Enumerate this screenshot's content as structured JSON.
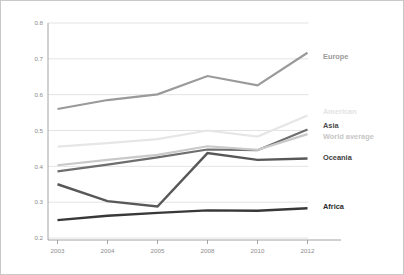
{
  "chart_data": {
    "type": "line",
    "title": "",
    "subtitle": "",
    "xlabel": "",
    "ylabel": "",
    "categories": [
      "2003",
      "2004",
      "2005",
      "2008",
      "2010",
      "2012"
    ],
    "x": [
      2003,
      2004,
      2005,
      2008,
      2010,
      2012
    ],
    "ylim": [
      0.2,
      0.8
    ],
    "yticks": [
      "0.2",
      "0.3",
      "0.4",
      "0.5",
      "0.6",
      "0.7",
      "0.8"
    ],
    "ytick_values": [
      0.2,
      0.3,
      0.4,
      0.5,
      0.6,
      0.7,
      0.8
    ],
    "grid": true,
    "legend_position": "right-inline-labels",
    "series": [
      {
        "name": "Europe",
        "label": "Europe",
        "color": "#9a9a9a",
        "width": 2.2,
        "label_color": "#9a9a9a",
        "label_y": 0.705,
        "values": [
          0.56,
          0.585,
          0.601,
          0.652,
          0.626,
          0.717
        ]
      },
      {
        "name": "American",
        "label": "American",
        "color": "#e6e6e6",
        "width": 2.2,
        "label_color": "#e3e3e3",
        "label_y": 0.552,
        "values": [
          0.455,
          0.465,
          0.476,
          0.5,
          0.483,
          0.542
        ]
      },
      {
        "name": "Asia",
        "label": "Asia",
        "color": "#6e6e6e",
        "width": 2.2,
        "label_color": "#4a4a4a",
        "label_y": 0.512,
        "values": [
          0.386,
          0.405,
          0.425,
          0.447,
          0.445,
          0.503
        ]
      },
      {
        "name": "World average",
        "label": "World average",
        "color": "#c9c9c9",
        "width": 2.2,
        "label_color": "#c6c6c6",
        "label_y": 0.482,
        "values": [
          0.403,
          0.418,
          0.432,
          0.456,
          0.446,
          0.49
        ]
      },
      {
        "name": "Oceania",
        "label": "Oceania",
        "color": "#585858",
        "width": 2.4,
        "label_color": "#404040",
        "label_y": 0.424,
        "values": [
          0.35,
          0.303,
          0.288,
          0.437,
          0.418,
          0.422
        ]
      },
      {
        "name": "Africa",
        "label": "Africa",
        "color": "#383838",
        "width": 2.4,
        "label_color": "#2b2b2b",
        "label_y": 0.285,
        "values": [
          0.25,
          0.262,
          0.27,
          0.277,
          0.276,
          0.283
        ]
      }
    ]
  },
  "colors": {
    "frame_border": "#c9c9c9",
    "grid": "#dcdcdc",
    "axis": "#9a9a9a",
    "tick_text": "#8c8c8c",
    "background": "#ffffff"
  }
}
